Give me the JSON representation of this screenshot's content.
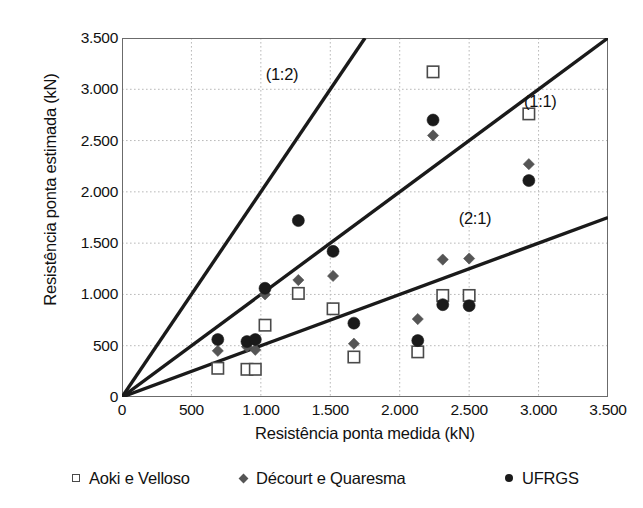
{
  "chart_data": {
    "type": "scatter",
    "title": "",
    "xlabel": "Resistência ponta medida (kN)",
    "ylabel": "Resistência ponta estimada (kN)",
    "xlim": [
      0,
      3500
    ],
    "ylim": [
      0,
      3500
    ],
    "xticks": [
      "0",
      "500",
      "1.000",
      "1.500",
      "2.000",
      "2.500",
      "3.000",
      "3.500"
    ],
    "xtick_values": [
      0,
      500,
      1000,
      1500,
      2000,
      2500,
      3000,
      3500
    ],
    "yticks": [
      "0",
      "500",
      "1.000",
      "1.500",
      "2.000",
      "2.500",
      "3.000",
      "3.500"
    ],
    "ytick_values": [
      0,
      500,
      1000,
      1500,
      2000,
      2500,
      3000,
      3500
    ],
    "grid": true,
    "legend_position": "below",
    "series": [
      {
        "name": "Aoki e Velloso",
        "marker": "open-square",
        "color": "#4a4a4a",
        "points": [
          [
            690,
            280
          ],
          [
            900,
            270
          ],
          [
            960,
            270
          ],
          [
            1030,
            700
          ],
          [
            1270,
            1010
          ],
          [
            1520,
            860
          ],
          [
            1670,
            390
          ],
          [
            2130,
            440
          ],
          [
            2240,
            3170
          ],
          [
            2310,
            990
          ],
          [
            2500,
            990
          ],
          [
            2930,
            2760
          ]
        ]
      },
      {
        "name": "Décourt e Quaresma",
        "marker": "filled-diamond",
        "color": "#555555",
        "points": [
          [
            690,
            450
          ],
          [
            900,
            490
          ],
          [
            960,
            460
          ],
          [
            1030,
            1000
          ],
          [
            1270,
            1140
          ],
          [
            1520,
            1180
          ],
          [
            1670,
            520
          ],
          [
            2130,
            760
          ],
          [
            2240,
            2550
          ],
          [
            2310,
            1340
          ],
          [
            2500,
            1350
          ],
          [
            2930,
            2270
          ]
        ]
      },
      {
        "name": "UFRGS",
        "marker": "filled-circle",
        "color": "#1a1a1a",
        "points": [
          [
            690,
            560
          ],
          [
            900,
            540
          ],
          [
            960,
            560
          ],
          [
            1030,
            1060
          ],
          [
            1270,
            1720
          ],
          [
            1520,
            1420
          ],
          [
            1670,
            720
          ],
          [
            2130,
            550
          ],
          [
            2240,
            2700
          ],
          [
            2310,
            900
          ],
          [
            2500,
            890
          ],
          [
            2930,
            2110
          ]
        ]
      }
    ],
    "reference_lines": [
      {
        "label": "(1:2)",
        "slope": 2.0,
        "label_x": 1230,
        "label_y": 3140
      },
      {
        "label": "(1:1)",
        "slope": 1.0,
        "label_x": 3090,
        "label_y": 2880
      },
      {
        "label": "(2:1)",
        "slope": 0.5,
        "label_x": 2620,
        "label_y": 1740
      }
    ]
  },
  "legend": {
    "items": [
      {
        "label": "Aoki e Velloso",
        "marker": "open-square-icon",
        "left": 72
      },
      {
        "label": "Décourt e Quaresma",
        "marker": "filled-diamond-icon",
        "left": 240
      },
      {
        "label": "UFRGS",
        "marker": "filled-circle-icon",
        "left": 505
      }
    ]
  }
}
